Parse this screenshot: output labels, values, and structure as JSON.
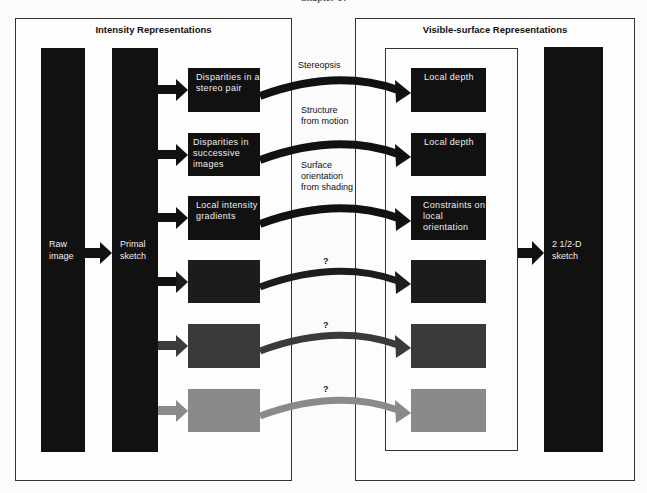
{
  "header": {
    "chapter": "Chapter 1?"
  },
  "panels": {
    "left": {
      "title": "Intensity Representations"
    },
    "right": {
      "title": "Visible-surface Representations"
    }
  },
  "bars": {
    "raw_image": "Raw image",
    "primal_sketch": "Primal sketch",
    "sketch_2_5d": "2 1/2-D sketch"
  },
  "rows": [
    {
      "source": "Disparities in a stereo pair",
      "process": "Stereopsis",
      "target": "Local depth",
      "color": "#111111"
    },
    {
      "source": "Disparities in successive images",
      "process": "Structure from motion",
      "target": "Local depth",
      "color": "#111111"
    },
    {
      "source": "Local intensity gradients",
      "process": "Surface orientation from shading",
      "target": "Constraints on local orientation",
      "color": "#111111"
    },
    {
      "source": "",
      "process": "?",
      "target": "",
      "color": "#1c1c1c"
    },
    {
      "source": "",
      "process": "?",
      "target": "",
      "color": "#3a3a3a"
    },
    {
      "source": "",
      "process": "?",
      "target": "",
      "color": "#8a8a8a"
    }
  ]
}
